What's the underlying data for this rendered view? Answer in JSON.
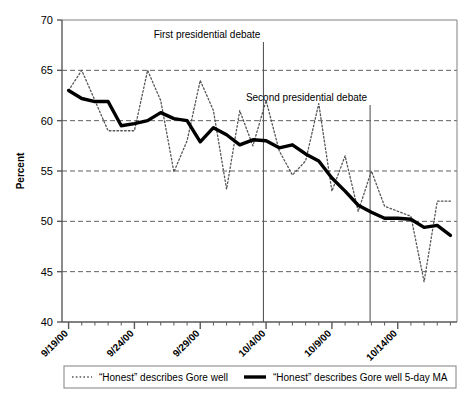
{
  "chart_data": {
    "type": "line",
    "title": "",
    "xlabel": "",
    "ylabel": "Percent",
    "ylim": [
      40,
      70
    ],
    "yticks": [
      40,
      45,
      50,
      55,
      60,
      65,
      70
    ],
    "grid": true,
    "legend_position": "bottom",
    "x_start_label": "9/19/00",
    "x_tick_labels": [
      "9/19/00",
      "9/24/00",
      "9/29/00",
      "10/4/00",
      "10/9/00",
      "10/14/00"
    ],
    "x_tick_indices": [
      0,
      5,
      10,
      15,
      20,
      25
    ],
    "x_minor_ticks_every": 1,
    "n_points": 30,
    "series": [
      {
        "name": "“Honest” describes Gore well",
        "style": "dotted",
        "color": "#555555",
        "values": [
          63.0,
          65.0,
          62.0,
          59.0,
          59.0,
          59.0,
          65.0,
          62.0,
          54.9,
          58.0,
          64.0,
          61.0,
          53.2,
          61.0,
          57.5,
          62.0,
          57.0,
          54.6,
          56.0,
          61.7,
          53.0,
          56.5,
          51.0,
          55.0,
          51.5,
          51.0,
          50.5,
          44.0,
          52.0,
          52.0
        ]
      },
      {
        "name": "“Honest” describes Gore well 5-day MA",
        "style": "solid",
        "color": "#000000",
        "values": [
          63.0,
          62.2,
          61.9,
          61.9,
          59.5,
          59.7,
          60.0,
          60.8,
          60.2,
          60.0,
          57.9,
          59.3,
          58.6,
          57.6,
          58.1,
          58.0,
          57.3,
          57.6,
          56.7,
          56.0,
          54.3,
          53.0,
          51.6,
          50.9,
          50.3,
          50.3,
          50.2,
          49.4,
          49.6,
          48.6
        ]
      }
    ],
    "annotations": [
      {
        "label": "First presidential debate",
        "x_index": 14.8,
        "text_anchor": "end",
        "text_y": 38
      },
      {
        "label": "Second presidential debate",
        "x_index": 22.9,
        "text_anchor": "end",
        "text_y": 101
      }
    ]
  },
  "legend": {
    "items": [
      {
        "label": "“Honest” describes Gore well",
        "style": "dotted"
      },
      {
        "label": "“Honest” describes Gore well 5-day MA",
        "style": "solid"
      }
    ]
  }
}
